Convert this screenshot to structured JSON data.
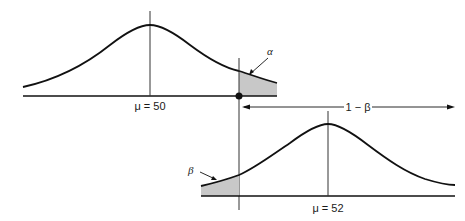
{
  "figure": {
    "top_distribution": {
      "mean_label": "μ = 50",
      "tail_label": "α",
      "tail_description": "Type I error region (upper tail beyond critical value)"
    },
    "bottom_distribution": {
      "mean_label": "μ = 52",
      "tail_label": "β",
      "tail_description": "Type II error region (lower tail below critical value)"
    },
    "power_label": "1 − β",
    "colors": {
      "line": "#111111",
      "shade": "#c8c8c8",
      "background": "#ffffff"
    }
  }
}
